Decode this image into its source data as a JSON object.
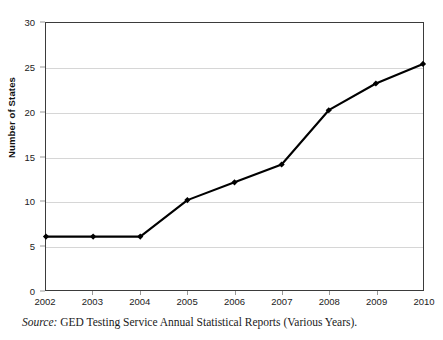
{
  "chart_data": {
    "type": "line",
    "title": "",
    "xlabel": "",
    "ylabel": "Number of States",
    "categories": [
      "2002",
      "2003",
      "2004",
      "2005",
      "2006",
      "2007",
      "2008",
      "2009",
      "2010"
    ],
    "values": [
      6,
      6,
      6,
      10.1,
      12.1,
      14.1,
      20.2,
      23.2,
      25.4
    ],
    "ylim": [
      0,
      30
    ],
    "yticks": [
      0,
      5,
      10,
      15,
      20,
      25,
      30
    ],
    "ytick_labels": [
      "0",
      "5",
      "10",
      "15",
      "20",
      "25",
      "30"
    ],
    "grid": "horizontal",
    "legend": "none",
    "series": [
      {
        "name": "Number of States",
        "values": [
          6,
          6,
          6,
          10.1,
          12.1,
          14.1,
          20.2,
          23.2,
          25.4
        ],
        "marker": "diamond",
        "color": "#000000"
      }
    ]
  },
  "axes": {
    "y_title": "Number of States",
    "y_tick_labels": [
      "30",
      "25",
      "20",
      "15",
      "10",
      "5",
      "0"
    ],
    "x_tick_labels": [
      "2002",
      "2003",
      "2004",
      "2005",
      "2006",
      "2007",
      "2008",
      "2009",
      "2010"
    ]
  },
  "title": {
    "text": ""
  },
  "source": {
    "label": "Source:",
    "text": " GED Testing Service Annual Statistical Reports (Various Years)."
  },
  "colors": {
    "series": "#000000",
    "frame": "#3b3b3b",
    "grid": "#d6d6d6",
    "text": "#1a1a1a"
  }
}
